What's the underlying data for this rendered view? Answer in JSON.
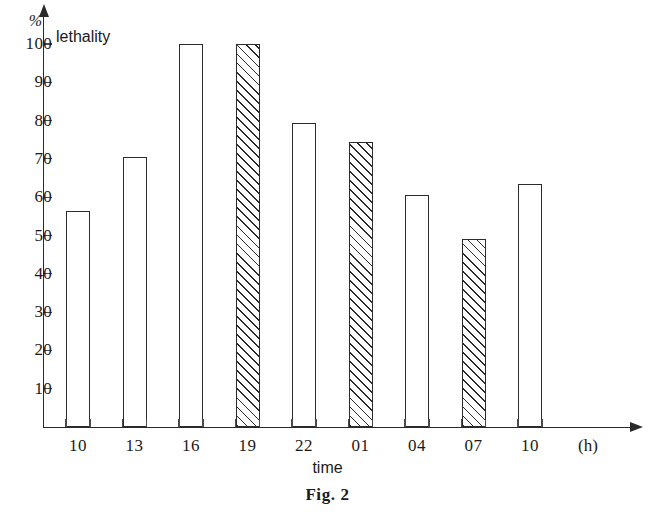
{
  "caption": "Fig. 2",
  "axes": {
    "y_unit": "%",
    "y_title": "lethality",
    "x_title": "time",
    "x_unit": "(h)",
    "y_ticks": [
      "100",
      "90",
      "80",
      "70",
      "60",
      "50",
      "40",
      "30",
      "20",
      "10"
    ]
  },
  "chart_data": {
    "type": "bar",
    "title": "Fig. 2",
    "xlabel": "time",
    "ylabel": "lethality",
    "y_unit": "%",
    "x_unit": "(h)",
    "ylim": [
      0,
      100
    ],
    "ytick_step": 10,
    "grid": false,
    "legend": "none",
    "categories": [
      "10",
      "13",
      "16",
      "19",
      "22",
      "01",
      "04",
      "07",
      "10"
    ],
    "values": [
      56.5,
      70.5,
      100,
      100,
      79.5,
      74.5,
      60.5,
      49,
      63.5
    ],
    "bar_styles": [
      "open",
      "open",
      "open",
      "hatched",
      "open",
      "hatched",
      "open",
      "hatched",
      "open"
    ],
    "colors": {
      "bar_outline": "#2b2b2b",
      "bar_fill_open": "#ffffff",
      "bar_hatch": "#2b2b2b",
      "axis": "#2a2a2a"
    }
  }
}
